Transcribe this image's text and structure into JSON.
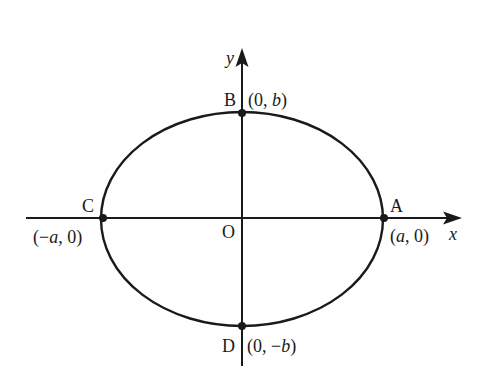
{
  "diagram": {
    "type": "ellipse-on-axes",
    "canvas": {
      "width": 493,
      "height": 378
    },
    "colors": {
      "background": "#ffffff",
      "stroke": "#1a1a1a"
    },
    "origin": {
      "label": "O",
      "x": 242,
      "y": 218
    },
    "ellipse": {
      "cx": 242,
      "cy": 219,
      "rx": 141,
      "ry": 107
    },
    "axes": {
      "x": {
        "label": "x",
        "from": 26,
        "to": 460,
        "y": 218
      },
      "y": {
        "label": "y",
        "from": 366,
        "to": 50,
        "x": 242
      }
    },
    "points": [
      {
        "id": "A",
        "label": "A",
        "coords": "(a, 0)",
        "x": 384,
        "y": 218
      },
      {
        "id": "B",
        "label": "B",
        "coords": "(0, b)",
        "x": 242,
        "y": 113
      },
      {
        "id": "C",
        "label": "C",
        "coords": "(−a, 0)",
        "x": 103,
        "y": 218
      },
      {
        "id": "D",
        "label": "D",
        "coords": "(0, −b)",
        "x": 242,
        "y": 326
      }
    ]
  },
  "labels": {
    "x_axis": "x",
    "y_axis": "y",
    "origin": "O",
    "A": "A",
    "B": "B",
    "C": "C",
    "D": "D",
    "A_coords_open": "(",
    "A_coords_var": "a",
    "A_coords_close": ", 0)",
    "B_coords_open": "(0, ",
    "B_coords_var": "b",
    "B_coords_close": ")",
    "C_coords_open": "(−",
    "C_coords_var": "a",
    "C_coords_close": ", 0)",
    "D_coords_open": "(0, −",
    "D_coords_var": "b",
    "D_coords_close": ")"
  }
}
